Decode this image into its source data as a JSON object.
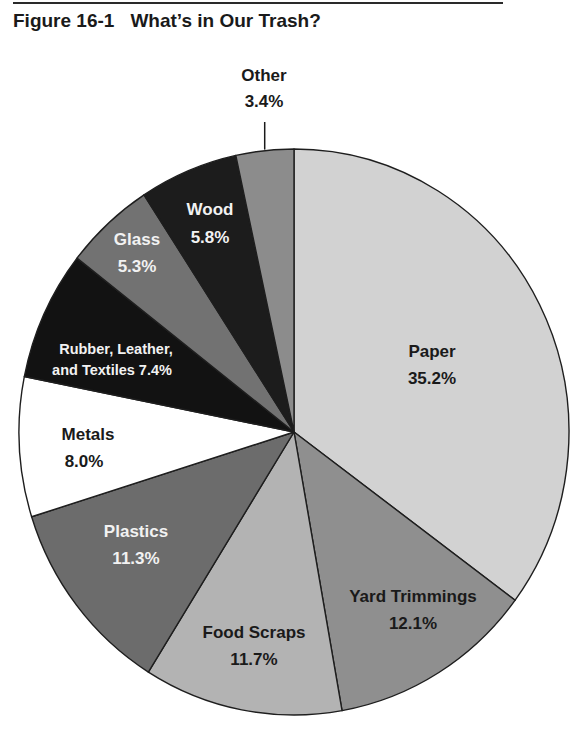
{
  "figure": {
    "number": "Figure 16-1",
    "title": "What’s in Our Trash?"
  },
  "chart_data": {
    "type": "pie",
    "title": "What’s in Our Trash?",
    "start": "top",
    "direction": "clockwise",
    "slices": [
      {
        "label": "Paper",
        "value": 35.2,
        "value_label": "35.2%",
        "color": "#d2d2d2",
        "text_color": "#1a1a1a"
      },
      {
        "label": "Yard Trimmings",
        "value": 12.1,
        "value_label": "12.1%",
        "color": "#8f8f8f",
        "text_color": "#1a1a1a"
      },
      {
        "label": "Food Scraps",
        "value": 11.7,
        "value_label": "11.7%",
        "color": "#b3b3b3",
        "text_color": "#1a1a1a"
      },
      {
        "label": "Plastics",
        "value": 11.3,
        "value_label": "11.3%",
        "color": "#6c6c6c",
        "text_color": "#f2f2f2"
      },
      {
        "label": "Metals",
        "value": 8.0,
        "value_label": "8.0%",
        "color": "#ffffff",
        "text_color": "#1a1a1a"
      },
      {
        "label": "Rubber, Leather, and Textiles",
        "value": 7.4,
        "value_label": "7.4%",
        "color": "#121212",
        "text_color": "#f2f2f2"
      },
      {
        "label": "Glass",
        "value": 5.3,
        "value_label": "5.3%",
        "color": "#727272",
        "text_color": "#f2f2f2"
      },
      {
        "label": "Wood",
        "value": 5.8,
        "value_label": "5.8%",
        "color": "#1c1c1c",
        "text_color": "#f2f2f2"
      },
      {
        "label": "Other",
        "value": 3.4,
        "value_label": "3.4%",
        "color": "#8c8c8c",
        "text_color": "#1a1a1a"
      }
    ],
    "label_lines": {
      "paper": [
        "Paper",
        "35.2%"
      ],
      "yard": [
        "Yard Trimmings",
        "12.1%"
      ],
      "food": [
        "Food Scraps",
        "11.7%"
      ],
      "plastics": [
        "Plastics",
        "11.3%"
      ],
      "metals": [
        "Metals",
        "8.0%"
      ],
      "rubber": [
        "Rubber, Leather,",
        "and Textiles 7.4%"
      ],
      "glass": [
        "Glass",
        "5.3%"
      ],
      "wood": [
        "Wood",
        "5.8%"
      ],
      "other": [
        "Other",
        "3.4%"
      ]
    }
  }
}
